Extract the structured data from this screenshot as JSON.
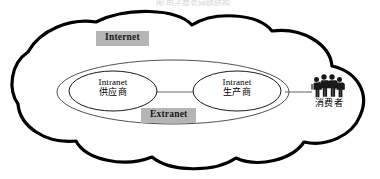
{
  "figure": {
    "kind": "network-architecture-diagram",
    "caption_fragment": "图 电子商务网络结构",
    "cloud": {
      "name": "internet-cloud",
      "label": "Internet",
      "outline_color": "#000000",
      "fill_color": "#ffffff"
    },
    "extranet": {
      "name": "extranet-ellipse",
      "label": "Extranet",
      "outline_color": "#3c3c3c",
      "fill_color": "#ffffff"
    },
    "nodes": [
      {
        "id": "supplier",
        "en": "Intranet",
        "cn": "供应商",
        "outline_color": "#1a1a1a"
      },
      {
        "id": "producer",
        "en": "Intranet",
        "cn": "生产商",
        "outline_color": "#1a1a1a"
      }
    ],
    "consumer": {
      "id": "consumer",
      "icon": "people-group-icon",
      "label": "消费者",
      "figure_count": 4,
      "color": "#1a1a1a"
    },
    "links": [
      {
        "id": "supplier-producer-link",
        "from": "supplier",
        "to": "producer",
        "color": "#6e6e6e"
      },
      {
        "id": "producer-consumer-link",
        "from": "producer",
        "to": "consumer",
        "color": "#6e6e6e"
      }
    ],
    "colors": {
      "chip_background": "#b5b5b5",
      "chip_text": "#1a1a1a",
      "stroke": "#000000",
      "thin_stroke": "#3c3c3c",
      "link": "#6e6e6e",
      "page_background": "#ffffff"
    }
  }
}
